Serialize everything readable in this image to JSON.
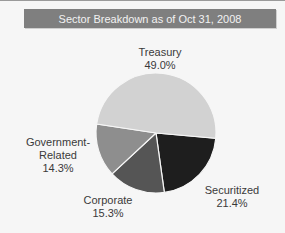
{
  "title": "Sector Breakdown as of Oct 31, 2008",
  "chart_data": {
    "type": "pie",
    "title": "Sector Breakdown as of Oct 31, 2008",
    "categories": [
      "Treasury",
      "Securitized",
      "Corporate",
      "Government-Related"
    ],
    "values": [
      49.0,
      21.4,
      15.3,
      14.3
    ],
    "value_labels": [
      "49.0%",
      "21.4%",
      "15.3%",
      "14.3%"
    ],
    "colors": [
      "#d2d2d2",
      "#1e1e1e",
      "#555555",
      "#8e8e8e"
    ],
    "legend": "none (data labels on slices)"
  },
  "labels": {
    "treasury": {
      "name": "Treasury",
      "pct": "49.0%"
    },
    "securitized": {
      "name": "Securitized",
      "pct": "21.4%"
    },
    "corporate": {
      "name": "Corporate",
      "pct": "15.3%"
    },
    "government": {
      "name_line1": "Government-",
      "name_line2": "Related",
      "pct": "14.3%"
    }
  }
}
